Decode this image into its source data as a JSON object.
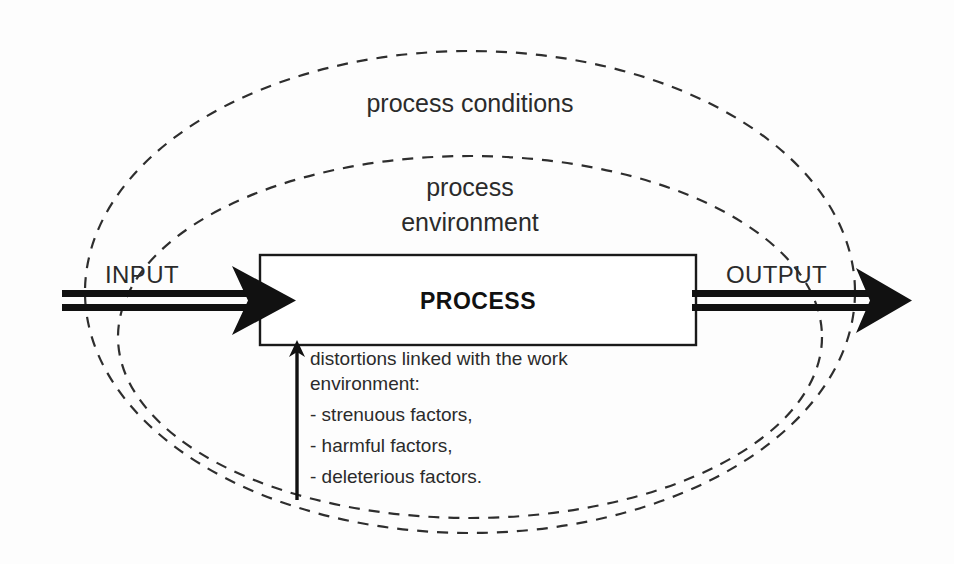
{
  "diagram": {
    "outer_ellipse_label": "process conditions",
    "inner_ellipse_label_line1": "process",
    "inner_ellipse_label_line2": "environment",
    "input_label": "INPUT",
    "output_label": "OUTPUT",
    "process_label": "PROCESS",
    "note_lines": [
      "distortions linked with the work",
      "environment:",
      "- strenuous factors,",
      "- harmful factors,",
      "- deleterious factors."
    ],
    "colors": {
      "background": "#fdfdfd",
      "ink": "#111111",
      "text": "#2b2b2b",
      "dashed_stroke": "#2e2e2e",
      "box_fill": "#ffffff"
    }
  }
}
